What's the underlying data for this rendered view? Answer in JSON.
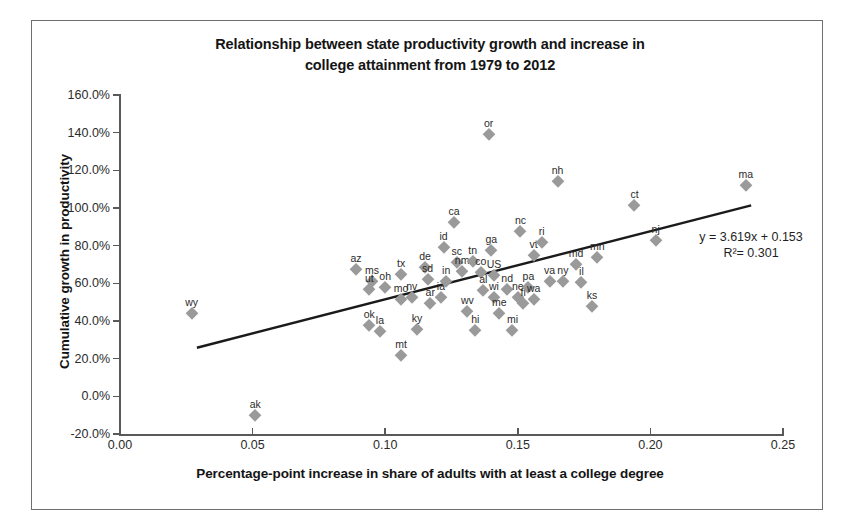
{
  "chart_data": {
    "type": "scatter",
    "title": "Relationship between state productivity growth and increase in college attainment from 1979 to 2012",
    "title_line1": "Relationship between state productivity growth and increase in",
    "title_line2": "college attainment from 1979 to 2012",
    "xlabel": "Percentage-point increase in share of adults with at least a college degree",
    "ylabel": "Cumulative growth in productivity",
    "xlim": [
      0.0,
      0.25
    ],
    "ylim": [
      -0.2,
      1.6
    ],
    "xticks": [
      "0.00",
      "0.05",
      "0.10",
      "0.15",
      "0.20",
      "0.25"
    ],
    "xtick_values": [
      0.0,
      0.05,
      0.1,
      0.15,
      0.2,
      0.25
    ],
    "yticks": [
      "-20.0%",
      "0.0%",
      "20.0%",
      "40.0%",
      "60.0%",
      "80.0%",
      "100.0%",
      "120.0%",
      "140.0%",
      "160.0%"
    ],
    "ytick_values": [
      -0.2,
      0.0,
      0.2,
      0.4,
      0.6,
      0.8,
      1.0,
      1.2,
      1.4,
      1.6
    ],
    "grid": false,
    "legend": false,
    "marker_color": "#9a9a9a",
    "marker_shape": "diamond",
    "trendline": {
      "equation": "y = 3.619x + 0.153",
      "r2_label": "R²= 0.301",
      "slope": 3.619,
      "intercept": 0.153,
      "r_squared": 0.301,
      "color": "#1a1a1a",
      "x_start": 0.029,
      "x_end": 0.238
    },
    "points": [
      {
        "label": "wy",
        "x": 0.027,
        "y": 0.442
      },
      {
        "label": "ak",
        "x": 0.051,
        "y": -0.1
      },
      {
        "label": "az",
        "x": 0.089,
        "y": 0.675
      },
      {
        "label": "ms",
        "x": 0.095,
        "y": 0.612
      },
      {
        "label": "ut",
        "x": 0.094,
        "y": 0.57
      },
      {
        "label": "oh",
        "x": 0.1,
        "y": 0.583
      },
      {
        "label": "tx",
        "x": 0.106,
        "y": 0.648
      },
      {
        "label": "ok",
        "x": 0.094,
        "y": 0.378
      },
      {
        "label": "la",
        "x": 0.098,
        "y": 0.345
      },
      {
        "label": "mt",
        "x": 0.106,
        "y": 0.22
      },
      {
        "label": "mo",
        "x": 0.106,
        "y": 0.518
      },
      {
        "label": "nv",
        "x": 0.11,
        "y": 0.53
      },
      {
        "label": "ky",
        "x": 0.112,
        "y": 0.355
      },
      {
        "label": "de",
        "x": 0.115,
        "y": 0.685
      },
      {
        "label": "sd",
        "x": 0.116,
        "y": 0.625
      },
      {
        "label": "ar",
        "x": 0.117,
        "y": 0.495
      },
      {
        "label": "ia",
        "x": 0.121,
        "y": 0.528
      },
      {
        "label": "id",
        "x": 0.122,
        "y": 0.795
      },
      {
        "label": "in",
        "x": 0.123,
        "y": 0.61
      },
      {
        "label": "ca",
        "x": 0.126,
        "y": 0.925
      },
      {
        "label": "sc",
        "x": 0.127,
        "y": 0.715
      },
      {
        "label": "nm",
        "x": 0.129,
        "y": 0.665
      },
      {
        "label": "wv",
        "x": 0.131,
        "y": 0.455
      },
      {
        "label": "hi",
        "x": 0.134,
        "y": 0.35
      },
      {
        "label": "tn",
        "x": 0.133,
        "y": 0.718
      },
      {
        "label": "co",
        "x": 0.136,
        "y": 0.66
      },
      {
        "label": "al",
        "x": 0.137,
        "y": 0.565
      },
      {
        "label": "or",
        "x": 0.139,
        "y": 1.395
      },
      {
        "label": "ga",
        "x": 0.14,
        "y": 0.775
      },
      {
        "label": "US",
        "x": 0.141,
        "y": 0.645
      },
      {
        "label": "wi",
        "x": 0.141,
        "y": 0.53
      },
      {
        "label": "me",
        "x": 0.143,
        "y": 0.442
      },
      {
        "label": "nd",
        "x": 0.146,
        "y": 0.572
      },
      {
        "label": "mi",
        "x": 0.148,
        "y": 0.352
      },
      {
        "label": "ne",
        "x": 0.15,
        "y": 0.528
      },
      {
        "label": "nc",
        "x": 0.151,
        "y": 0.88
      },
      {
        "label": "fl",
        "x": 0.152,
        "y": 0.498
      },
      {
        "label": "pa",
        "x": 0.154,
        "y": 0.582
      },
      {
        "label": "wa",
        "x": 0.156,
        "y": 0.515
      },
      {
        "label": "vt",
        "x": 0.156,
        "y": 0.752
      },
      {
        "label": "ri",
        "x": 0.159,
        "y": 0.822
      },
      {
        "label": "va",
        "x": 0.162,
        "y": 0.61
      },
      {
        "label": "nh",
        "x": 0.165,
        "y": 1.142
      },
      {
        "label": "ny",
        "x": 0.167,
        "y": 0.615
      },
      {
        "label": "md",
        "x": 0.172,
        "y": 0.702
      },
      {
        "label": "il",
        "x": 0.174,
        "y": 0.608
      },
      {
        "label": "ks",
        "x": 0.178,
        "y": 0.48
      },
      {
        "label": "mn",
        "x": 0.18,
        "y": 0.742
      },
      {
        "label": "ct",
        "x": 0.194,
        "y": 1.018
      },
      {
        "label": "nj",
        "x": 0.202,
        "y": 0.832
      },
      {
        "label": "ma",
        "x": 0.236,
        "y": 1.122
      }
    ]
  }
}
